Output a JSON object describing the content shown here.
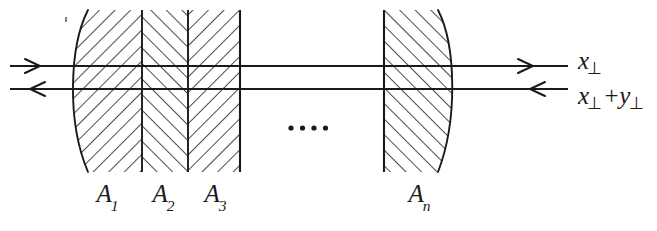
{
  "figure": {
    "kind": "optical-ray-diagram",
    "title": "",
    "background_color": "#ffffff",
    "ink_color": "#1a1a1a"
  },
  "elements": {
    "items": [
      {
        "id": "A1",
        "label": "A",
        "sub": "1",
        "label_x": 108,
        "hatch": "down-right"
      },
      {
        "id": "A2",
        "label": "A",
        "sub": "2",
        "label_x": 164,
        "hatch": "up-right"
      },
      {
        "id": "A3",
        "label": "A",
        "sub": "3",
        "label_x": 216,
        "hatch": "down-right"
      },
      {
        "id": "An",
        "label": "A",
        "sub": "n",
        "label_x": 420,
        "hatch": "up-right"
      }
    ]
  },
  "ellipsis": {
    "name": "continuation-dots",
    "count": 4,
    "x_start": 291,
    "y": 128,
    "spacing": 11.5,
    "radius": 2.6
  },
  "rays": [
    {
      "id": "ray-top",
      "direction": "right",
      "y": 66,
      "x_start": 10,
      "x_end": 568,
      "label": "x-perp"
    },
    {
      "id": "ray-bottom",
      "direction": "left",
      "y": 89,
      "x_start": 10,
      "x_end": 568,
      "label": "x-perp-plus-y-perp"
    }
  ],
  "labels": {
    "x_perp": {
      "base": "x",
      "perp": "⊥"
    },
    "x_perp_plus_y_perp": {
      "base1": "x",
      "perp1": "⊥",
      "op": "+",
      "base2": "y",
      "perp2": "⊥"
    }
  },
  "geometry": {
    "stack_top": 10,
    "stack_bottom": 172,
    "left_group_flat_right_x": 240,
    "left_group_bulge_x": 66,
    "left_group_inner_x": 88,
    "dividers_x": [
      142,
      188
    ],
    "an_flat_left_x": 384,
    "an_bulge_x": 458,
    "an_inner_x": 438
  }
}
